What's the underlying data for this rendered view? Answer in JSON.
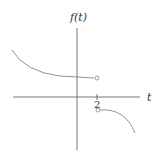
{
  "diagram": {
    "y_axis_label": "f(t)",
    "x_axis_label": "t",
    "tick_labels": [
      "2"
    ],
    "colors": {
      "axis": "#555555",
      "curve": "#777777",
      "text": "#333333",
      "background": "#ffffff"
    },
    "pieces": [
      {
        "name": "upper-branch",
        "domain": "t < 2",
        "endpoint": "open circle at t = 2",
        "shape": "decreasing concave-up curve"
      },
      {
        "name": "lower-branch",
        "domain": "t > 2",
        "endpoint": "open circle at t = 2",
        "shape": "decreasing concave-down curve"
      }
    ]
  }
}
